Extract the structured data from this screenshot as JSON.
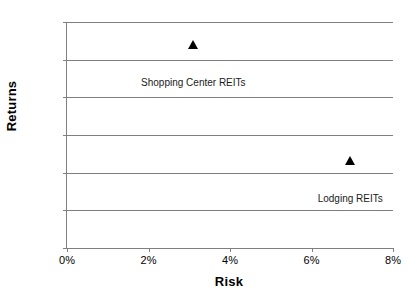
{
  "chart_data": {
    "type": "scatter",
    "title": "",
    "xlabel": "Risk",
    "ylabel": "Returns",
    "xlim": [
      0,
      8
    ],
    "ylim": [
      0,
      1.2
    ],
    "grid": true,
    "legend": "none",
    "x_tick_labels": [
      "0%",
      "2%",
      "4%",
      "6%",
      "8%"
    ],
    "x_tick_values": [
      0,
      2,
      4,
      6,
      8
    ],
    "y_tick_labels": [
      "0.0%",
      "0.2%",
      "0.4%",
      "0.6%",
      "0.8%",
      "1.0%",
      "1.2%"
    ],
    "y_tick_values": [
      0.0,
      0.2,
      0.4,
      0.6,
      0.8,
      1.0,
      1.2
    ],
    "marker_shape": "triangle",
    "marker_color": "#000000",
    "gridline_color": "#7f7f7f",
    "axis_color": "#808080",
    "points": [
      {
        "name": "Shopping Center REITs",
        "label": "Shopping Center REITs",
        "x": 3.1,
        "y": 1.08,
        "label_dx": 0,
        "label_dy": 32
      },
      {
        "name": "Lodging REITs",
        "label": "Lodging REITs",
        "x": 6.95,
        "y": 0.46,
        "label_dx": 0,
        "label_dy": 32
      }
    ]
  }
}
